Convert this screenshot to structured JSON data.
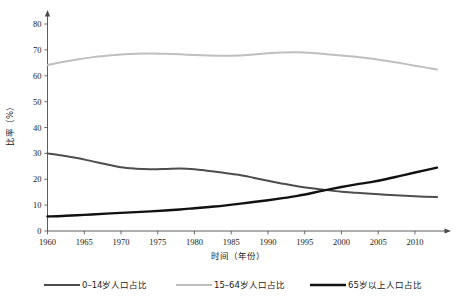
{
  "chart_data": {
    "type": "line",
    "title": "",
    "xlabel": "时间（年份）",
    "ylabel": "比率（%）",
    "xlim": [
      1960,
      2013
    ],
    "ylim": [
      0,
      85
    ],
    "yticks": [
      0,
      10,
      20,
      30,
      40,
      50,
      60,
      70,
      80
    ],
    "ytick_labels": [
      "0",
      "10",
      "20",
      "30",
      "40",
      "50",
      "60",
      "70",
      "80"
    ],
    "xticks": [
      1960,
      1965,
      1970,
      1975,
      1980,
      1985,
      1990,
      1995,
      2000,
      2005,
      2010
    ],
    "xtick_labels": [
      "1960",
      "1965",
      "1970",
      "1975",
      "1980",
      "1985",
      "1990",
      "1995",
      "2000",
      "2005",
      "2010"
    ],
    "grid": false,
    "legend_position": "bottom",
    "x": [
      1960,
      1962,
      1964,
      1966,
      1968,
      1970,
      1972,
      1974,
      1976,
      1978,
      1980,
      1982,
      1984,
      1986,
      1988,
      1990,
      1992,
      1994,
      1996,
      1998,
      2000,
      2002,
      2004,
      2006,
      2008,
      2010,
      2013
    ],
    "series": [
      {
        "name": "0–14岁人口占比",
        "color": "#4d4d4d",
        "width": 2.0,
        "values": [
          30.0,
          29.2,
          28.2,
          27.0,
          25.8,
          24.6,
          24.1,
          23.9,
          24.0,
          24.2,
          23.9,
          23.2,
          22.5,
          21.7,
          20.6,
          19.4,
          18.3,
          17.3,
          16.5,
          15.8,
          15.2,
          14.8,
          14.4,
          14.0,
          13.7,
          13.4,
          13.1
        ]
      },
      {
        "name": "15–64岁人口占比",
        "color": "#bfbfbf",
        "width": 2.0,
        "values": [
          64.1,
          65.3,
          66.3,
          67.1,
          67.7,
          68.2,
          68.5,
          68.6,
          68.5,
          68.3,
          68.0,
          67.8,
          67.7,
          67.8,
          68.2,
          68.7,
          69.0,
          69.1,
          68.8,
          68.3,
          67.8,
          67.3,
          66.7,
          65.8,
          64.9,
          63.9,
          62.4
        ]
      },
      {
        "name": "65岁以上人口占比",
        "color": "#111111",
        "width": 2.4,
        "values": [
          5.6,
          5.8,
          6.1,
          6.4,
          6.7,
          7.0,
          7.3,
          7.6,
          7.9,
          8.3,
          8.8,
          9.3,
          9.8,
          10.5,
          11.2,
          11.9,
          12.7,
          13.6,
          14.7,
          15.9,
          17.0,
          18.0,
          18.9,
          20.0,
          21.3,
          22.6,
          24.5
        ]
      }
    ],
    "annotations": []
  },
  "legend": {
    "items": [
      {
        "label": "0–14岁人口占比",
        "color": "#4d4d4d",
        "width": 2.0
      },
      {
        "label": "15–64岁人口占比",
        "color": "#bfbfbf",
        "width": 2.0
      },
      {
        "label": "65岁以上人口占比",
        "color": "#111111",
        "width": 2.4
      }
    ]
  }
}
